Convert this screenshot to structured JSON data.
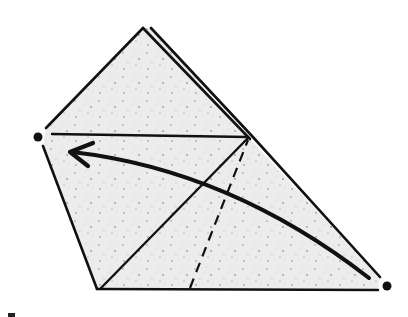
{
  "diagram": {
    "type": "origami-folding-diagram",
    "paper_fill": "#ebebeb",
    "speckle_color": "#b8b8b8",
    "line_color": "#111111",
    "elements": {
      "paper_outline": "quadrilateral flap with layered top edge",
      "crease_lines": [
        "horizontal crease from left dot to right edge",
        "diagonal crease from bottom-left to right edge point"
      ],
      "valley_fold_line": "dashed line from bottom edge to right edge point",
      "fold_arrow": "curved arrow from bottom-right corner to left dot",
      "reference_dots": [
        "left dot",
        "bottom-right dot"
      ]
    }
  }
}
